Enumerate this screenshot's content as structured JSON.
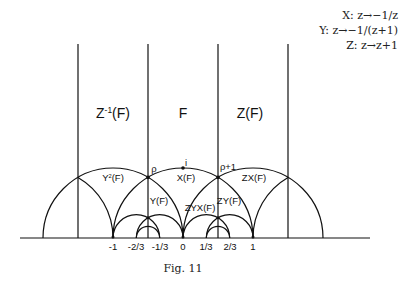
{
  "legend": {
    "x_map": "X: z→−1/z",
    "y_map": "Y: z→−1/(z+1)",
    "z_map": "Z: z→z+1"
  },
  "regions": {
    "z_inv_f_base": "Z",
    "z_inv_f_sup": "-1",
    "z_inv_f_tail": "(F)",
    "f": "F",
    "z_f": "Z(F)",
    "y2_f_base": "Y",
    "y2_f_sup": "2",
    "y2_f_tail": "(F)",
    "x_f": "X(F)",
    "zx_f": "ZX(F)",
    "y_f": "Y(F)",
    "zyx_f": "ZYX(F)",
    "zy_f": "ZY(F)"
  },
  "points": {
    "rho": "ρ",
    "rho_plus_1": "ρ+1",
    "i": "i"
  },
  "axis_ticks": [
    "-1",
    "-2/3",
    "-1/3",
    "0",
    "1/3",
    "2/3",
    "1"
  ],
  "caption": "Fig. 11",
  "geometry": {
    "origin_x": 183,
    "baseline_y": 238,
    "unit_px": 70,
    "vertical_lines_at": [
      -1.5,
      -0.5,
      0.5,
      1.5
    ],
    "line_color": "#111111"
  }
}
